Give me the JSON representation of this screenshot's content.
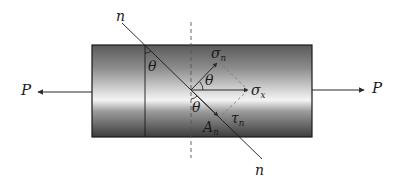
{
  "diagram": {
    "title": "",
    "colors": {
      "bar_dark": "#4a4a4a",
      "bar_mid": "#9a9a9a",
      "bar_light": "#f2f2f2",
      "line": "#1a1a1a",
      "dashed": "#555555",
      "dashed_light": "#777777"
    },
    "labels": {
      "force_left": "P",
      "force_right": "P",
      "section_top": "n",
      "section_bottom": "n",
      "angle_left": "θ",
      "angle_sigma": "θ",
      "angle_tau": "θ",
      "sigma_n": {
        "base": "σ",
        "sub": "n"
      },
      "sigma_x": {
        "base": "σ",
        "sub": "x"
      },
      "tau_n": {
        "base": "τ",
        "sub": "n"
      },
      "area_n": {
        "base": "A",
        "sub": "n"
      }
    }
  }
}
